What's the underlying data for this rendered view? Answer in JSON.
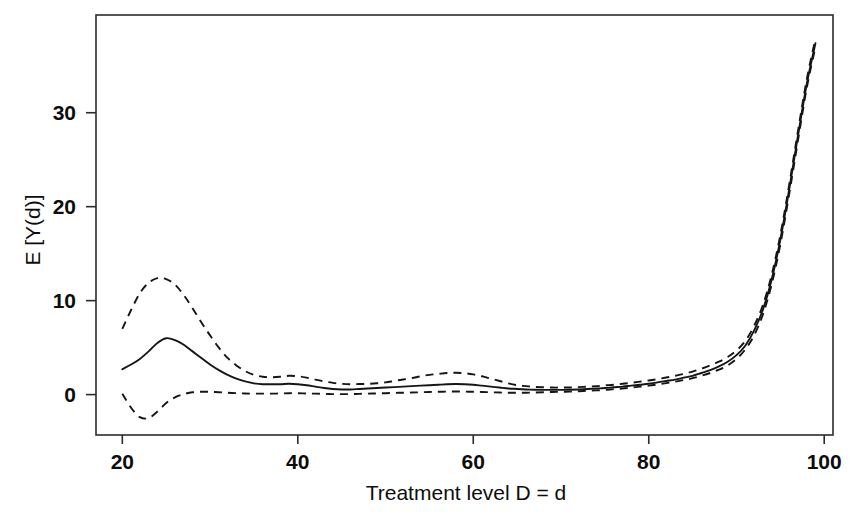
{
  "figure": {
    "background_color": "#ffffff",
    "line_color": "#151515",
    "frame_color": "#2b2b2b"
  },
  "chart_data": {
    "type": "line",
    "title": "",
    "subtitle": "",
    "xlabel": "Treatment level D = d",
    "ylabel": "E [Y(d)]",
    "xlim": [
      17,
      101
    ],
    "ylim": [
      -4.3,
      40.4
    ],
    "xticks": [
      20,
      40,
      60,
      80,
      100
    ],
    "xtick_labels": [
      "20",
      "40",
      "60",
      "80",
      "100"
    ],
    "yticks": [
      0,
      10,
      20,
      30
    ],
    "ytick_labels": [
      "0",
      "10",
      "20",
      "30"
    ],
    "grid": false,
    "legend": null,
    "legend_position": "none",
    "annotations": [],
    "x": [
      20,
      21,
      22,
      23,
      24,
      25,
      26,
      27,
      28,
      29,
      30,
      31,
      32,
      33,
      34,
      35,
      36,
      37,
      38,
      39,
      40,
      41,
      42,
      43,
      44,
      45,
      46,
      47,
      48,
      49,
      50,
      51,
      52,
      53,
      54,
      55,
      56,
      57,
      58,
      59,
      60,
      61,
      62,
      63,
      64,
      65,
      66,
      67,
      68,
      69,
      70,
      71,
      72,
      73,
      74,
      75,
      76,
      77,
      78,
      79,
      80,
      81,
      82,
      83,
      84,
      85,
      86,
      87,
      88,
      89,
      90,
      91,
      92,
      93,
      94,
      95,
      96,
      97,
      98,
      99
    ],
    "series": [
      {
        "name": "mean dose-response",
        "style": "solid",
        "values": [
          2.7,
          3.2,
          3.8,
          4.6,
          5.5,
          6.0,
          5.8,
          5.3,
          4.6,
          3.9,
          3.2,
          2.6,
          2.1,
          1.7,
          1.4,
          1.2,
          1.1,
          1.1,
          1.1,
          1.15,
          1.1,
          1.0,
          0.85,
          0.7,
          0.6,
          0.55,
          0.55,
          0.6,
          0.65,
          0.7,
          0.75,
          0.8,
          0.85,
          0.9,
          0.95,
          1.0,
          1.05,
          1.1,
          1.12,
          1.1,
          1.05,
          0.95,
          0.85,
          0.75,
          0.65,
          0.6,
          0.55,
          0.52,
          0.5,
          0.5,
          0.5,
          0.52,
          0.55,
          0.6,
          0.65,
          0.7,
          0.78,
          0.85,
          0.95,
          1.05,
          1.15,
          1.3,
          1.45,
          1.6,
          1.8,
          2.0,
          2.3,
          2.6,
          3.0,
          3.5,
          4.2,
          5.2,
          6.8,
          9.0,
          12.2,
          16.5,
          21.8,
          27.5,
          33.0,
          37.4
        ]
      },
      {
        "name": "upper confidence band",
        "style": "dashed",
        "values": [
          7.0,
          9.0,
          10.8,
          11.9,
          12.4,
          12.3,
          11.7,
          10.6,
          9.2,
          7.7,
          6.3,
          5.0,
          3.9,
          3.1,
          2.5,
          2.1,
          1.9,
          1.85,
          1.9,
          2.0,
          1.95,
          1.8,
          1.6,
          1.4,
          1.25,
          1.15,
          1.1,
          1.12,
          1.15,
          1.2,
          1.3,
          1.45,
          1.6,
          1.75,
          1.95,
          2.1,
          2.2,
          2.3,
          2.32,
          2.28,
          2.15,
          1.95,
          1.7,
          1.45,
          1.2,
          1.0,
          0.9,
          0.82,
          0.78,
          0.75,
          0.75,
          0.76,
          0.8,
          0.85,
          0.9,
          0.98,
          1.05,
          1.15,
          1.25,
          1.38,
          1.5,
          1.65,
          1.82,
          2.0,
          2.2,
          2.45,
          2.75,
          3.1,
          3.5,
          4.0,
          4.7,
          5.7,
          7.3,
          9.5,
          12.7,
          17.0,
          22.3,
          28.0,
          33.5,
          37.9
        ]
      },
      {
        "name": "lower confidence band",
        "style": "dashed",
        "values": [
          0.1,
          -1.4,
          -2.4,
          -2.5,
          -1.8,
          -0.9,
          -0.3,
          0.05,
          0.25,
          0.3,
          0.3,
          0.25,
          0.2,
          0.15,
          0.12,
          0.1,
          0.1,
          0.1,
          0.12,
          0.15,
          0.15,
          0.12,
          0.1,
          0.08,
          0.05,
          0.05,
          0.05,
          0.08,
          0.1,
          0.12,
          0.15,
          0.18,
          0.2,
          0.22,
          0.25,
          0.28,
          0.3,
          0.32,
          0.33,
          0.32,
          0.3,
          0.28,
          0.25,
          0.22,
          0.2,
          0.2,
          0.2,
          0.22,
          0.25,
          0.28,
          0.3,
          0.32,
          0.35,
          0.4,
          0.45,
          0.5,
          0.58,
          0.65,
          0.75,
          0.85,
          0.95,
          1.08,
          1.22,
          1.38,
          1.55,
          1.75,
          2.0,
          2.3,
          2.65,
          3.1,
          3.8,
          4.8,
          6.3,
          8.5,
          11.7,
          16.0,
          21.3,
          27.0,
          32.6,
          37.0
        ]
      }
    ]
  }
}
